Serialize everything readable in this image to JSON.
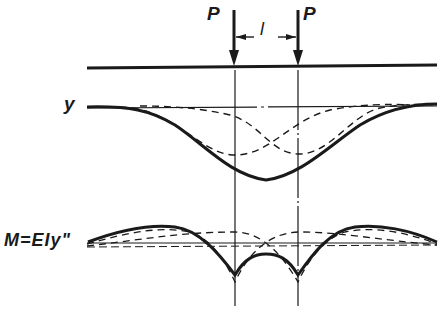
{
  "diagram": {
    "labels": {
      "load_left": "P",
      "load_right": "P",
      "spacing": "l",
      "deflection_axis": "y",
      "moment_axis": "M=EIy\""
    },
    "colors": {
      "ink": "#1a1a1a",
      "background": "#ffffff"
    },
    "elements": {
      "beam": "horizontal beam line",
      "loads": [
        "downward arrow P at left",
        "downward arrow P at right"
      ],
      "dimension": "spacing l between loads",
      "deflection_plot": {
        "solid_curve": "total deflection (superposition)",
        "dashed_curves": [
          "deflection due to left load",
          "deflection due to right load"
        ]
      },
      "moment_plot": {
        "solid_curve": "total bending moment",
        "dashed_curves": [
          "moment due to left load",
          "moment due to right load"
        ]
      }
    }
  }
}
